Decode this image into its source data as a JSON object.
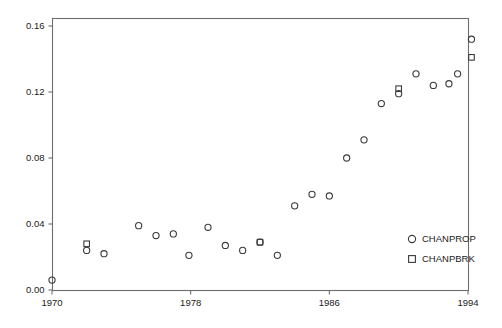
{
  "chart_data": {
    "type": "scatter",
    "title": "",
    "xlabel": "",
    "ylabel": "",
    "xlim": [
      1969.2,
      1994.6
    ],
    "ylim": [
      -0.004,
      0.166
    ],
    "xticks": [
      1970,
      1978,
      1986,
      1994
    ],
    "yticks": [
      0.0,
      0.04,
      0.08,
      0.12,
      0.16
    ],
    "xtick_labels": [
      "1970",
      "1978",
      "1986",
      "1994"
    ],
    "ytick_labels": [
      "0.00",
      "0.04",
      "0.08",
      "0.12",
      "0.16"
    ],
    "grid": false,
    "legend_position": "lower right",
    "series": [
      {
        "name": "CHANPROP",
        "marker": "circle",
        "color": "#3a3a3a",
        "points": [
          {
            "x": 1970.0,
            "y": 0.006
          },
          {
            "x": 1972.0,
            "y": 0.024
          },
          {
            "x": 1973.0,
            "y": 0.022
          },
          {
            "x": 1975.0,
            "y": 0.039
          },
          {
            "x": 1976.0,
            "y": 0.033
          },
          {
            "x": 1977.0,
            "y": 0.034
          },
          {
            "x": 1977.9,
            "y": 0.021
          },
          {
            "x": 1979.0,
            "y": 0.038
          },
          {
            "x": 1980.0,
            "y": 0.027
          },
          {
            "x": 1981.0,
            "y": 0.024
          },
          {
            "x": 1982.0,
            "y": 0.029
          },
          {
            "x": 1983.0,
            "y": 0.021
          },
          {
            "x": 1984.0,
            "y": 0.051
          },
          {
            "x": 1985.0,
            "y": 0.058
          },
          {
            "x": 1986.0,
            "y": 0.057
          },
          {
            "x": 1987.0,
            "y": 0.08
          },
          {
            "x": 1988.0,
            "y": 0.091
          },
          {
            "x": 1989.0,
            "y": 0.113
          },
          {
            "x": 1990.0,
            "y": 0.119
          },
          {
            "x": 1991.0,
            "y": 0.131
          },
          {
            "x": 1992.0,
            "y": 0.124
          },
          {
            "x": 1992.9,
            "y": 0.125
          },
          {
            "x": 1993.4,
            "y": 0.131
          },
          {
            "x": 1994.2,
            "y": 0.152
          }
        ]
      },
      {
        "name": "CHANPBRK",
        "marker": "square",
        "color": "#3a3a3a",
        "points": [
          {
            "x": 1972.0,
            "y": 0.028
          },
          {
            "x": 1982.0,
            "y": 0.029
          },
          {
            "x": 1990.0,
            "y": 0.122
          },
          {
            "x": 1994.2,
            "y": 0.141
          }
        ]
      }
    ]
  },
  "legend": {
    "entries": [
      {
        "label": "CHANPROP",
        "marker": "circle"
      },
      {
        "label": "CHANPBRK",
        "marker": "square"
      }
    ]
  },
  "axes": {
    "frame_color": "#6e6e6e"
  }
}
